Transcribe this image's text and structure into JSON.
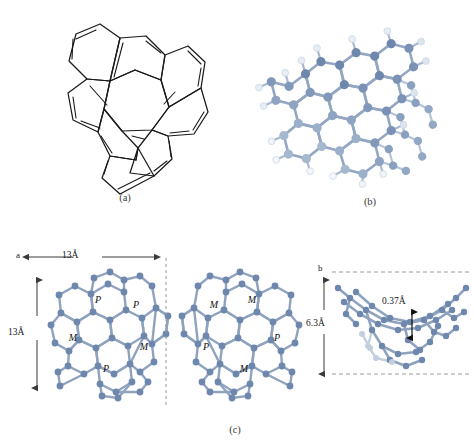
{
  "figure": {
    "top_artifact_text": "",
    "captions": [
      {
        "id": "a",
        "label": "(a)"
      },
      {
        "id": "b",
        "label": "(b)"
      },
      {
        "id": "c",
        "label": "(c)"
      }
    ]
  },
  "panel_a": {
    "name": "skeletal-structure",
    "description": "heptagon-centered polycyclic aromatic hydrocarbon skeletal formula"
  },
  "panel_b": {
    "name": "ball-and-stick-model",
    "description": "three dimensional ball and stick molecular model with hydrogens"
  },
  "panel_c": {
    "left": {
      "axis_label": "a",
      "width_dimension": "13Å",
      "height_dimension": "13Å",
      "ring_labels": [
        "P",
        "P",
        "M",
        "M",
        "P"
      ]
    },
    "middle": {
      "ring_labels": [
        "M",
        "M",
        "P",
        "P",
        "M"
      ]
    },
    "right": {
      "axis_label": "b",
      "height_dimension": "6.3Å",
      "offset_dimension": "0.37Å"
    }
  },
  "colors": {
    "atom_fill": "#6e87ad",
    "atom_fill_light": "#b8c6da",
    "atom_fill_pale": "#e3e9f1",
    "bond": "#8fa3bf",
    "bond_light": "#c3cfde",
    "skeletal_line": "#1a1a1a",
    "dimension_line": "#3a3a3a",
    "dashed_line": "#9a9a9a",
    "background": "#ffffff"
  }
}
